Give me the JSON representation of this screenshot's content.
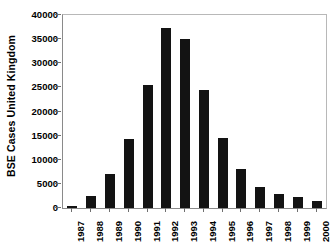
{
  "chart_data": {
    "type": "bar",
    "title": "",
    "subtitle": "",
    "xlabel": "",
    "ylabel": "BSE Cases  United Kingdom",
    "categories": [
      "1987",
      "1988",
      "1989",
      "1990",
      "1991",
      "1992",
      "1993",
      "1994",
      "1995",
      "1996",
      "1997",
      "1998",
      "1999",
      "2000"
    ],
    "values": [
      450,
      2500,
      7100,
      14400,
      25400,
      37300,
      35100,
      24400,
      14500,
      8100,
      4300,
      3000,
      2200,
      1400
    ],
    "series": [
      {
        "name": "BSE Cases United Kingdom",
        "values": [
          450,
          2500,
          7100,
          14400,
          25400,
          37300,
          35100,
          24400,
          14500,
          8100,
          4300,
          3000,
          2200,
          1400
        ]
      }
    ],
    "ylim": [
      0,
      40000
    ],
    "ytick_values": [
      0,
      5000,
      10000,
      15000,
      20000,
      25000,
      30000,
      35000,
      40000
    ],
    "ytick_labels": [
      "0",
      "5000",
      "10000",
      "15000",
      "20000",
      "25000",
      "30000",
      "35000",
      "40000"
    ],
    "xtick_labels": [
      "1987",
      "1988",
      "1989",
      "1990",
      "1991",
      "1992",
      "1993",
      "1994",
      "1995",
      "1996",
      "1997",
      "1998",
      "1999",
      "2000"
    ],
    "grid": false,
    "legend": false,
    "legend_position": "none",
    "bar_color": "#131313",
    "axis_color": "#8a8a8a",
    "plot_border_color": "#b8b8b8",
    "background_color": "#ffffff",
    "xtick_label_rotation": 90,
    "ylabel_rotation": 90
  }
}
